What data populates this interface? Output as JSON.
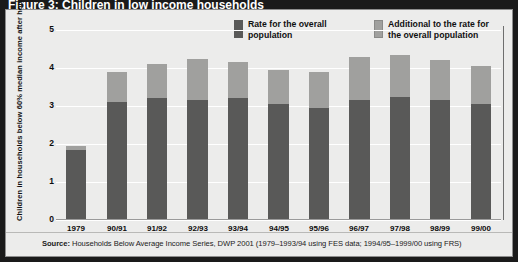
{
  "figure": {
    "title": "Figure 3: Children in low income households",
    "source_prefix": "Source:",
    "source_text": " Households Below Average Income Series, DWP 2001 (1979–1993/94 using FES data; 1994/95–1999/00 using FRS)"
  },
  "legend": {
    "items": [
      {
        "label": "Rate for the overall population",
        "color": "#595958",
        "key": "dark"
      },
      {
        "label": "Additional to the rate for the overall population",
        "color": "#a0a09e",
        "key": "light"
      }
    ]
  },
  "chart_data": {
    "type": "bar",
    "stacked": true,
    "title": "Children in low income households",
    "xlabel": "",
    "ylabel": "Children in households below 60% median income after housing costs (millions)",
    "ylim": [
      0,
      5
    ],
    "yticks": [
      "0",
      "1",
      "2",
      "3",
      "4",
      "5"
    ],
    "grid": true,
    "legend_position": "top-right",
    "categories": [
      "1979",
      "90/91",
      "91/92",
      "92/93",
      "93/94",
      "94/95",
      "95/96",
      "96/97",
      "97/98",
      "98/99",
      "99/00"
    ],
    "series": [
      {
        "name": "Rate for the overall population",
        "color": "#595958",
        "values": [
          1.85,
          3.1,
          3.2,
          3.15,
          3.2,
          3.05,
          2.95,
          3.15,
          3.25,
          3.15,
          3.05
        ]
      },
      {
        "name": "Additional to the rate for the overall population",
        "color": "#a0a09e",
        "values": [
          0.1,
          0.8,
          0.9,
          1.1,
          0.95,
          0.9,
          0.95,
          1.15,
          1.1,
          1.05,
          1.0
        ]
      }
    ],
    "totals": [
      1.95,
      3.9,
      4.1,
      4.25,
      4.15,
      3.95,
      3.9,
      4.3,
      4.35,
      4.2,
      4.05
    ]
  }
}
